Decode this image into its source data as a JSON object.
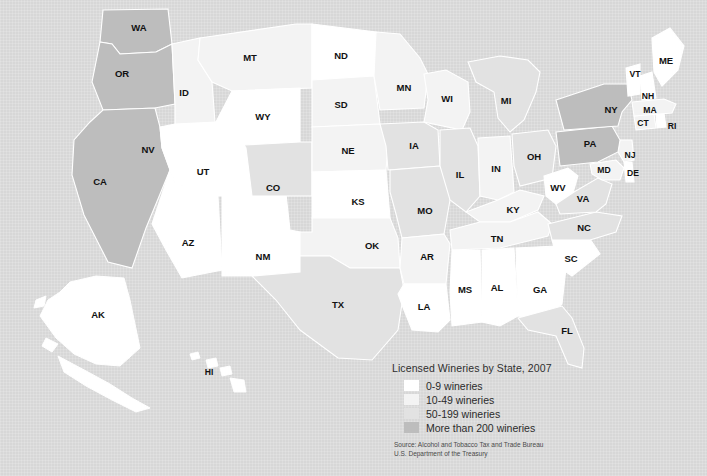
{
  "map": {
    "title": "Licensed Wineries by State, 2007",
    "background_color": "#d7d7d7",
    "border_color": "#ffffff",
    "label_color": "#111111"
  },
  "legend": {
    "title": "Licensed Wineries by State, 2007",
    "items": [
      {
        "label": "0-9 wineries",
        "color": "#ffffff"
      },
      {
        "label": "10-49 wineries",
        "color": "#f3f3f3"
      },
      {
        "label": "50-199 wineries",
        "color": "#e2e2e2"
      },
      {
        "label": "More than 200 wineries",
        "color": "#bdbdbd"
      }
    ],
    "source": "Source: Alcohol and Tobacco Tax and Trade Bureau\nU.S. Department of the Treasury"
  },
  "chart_data": {
    "type": "map",
    "title": "Licensed Wineries by State, 2007",
    "measure": "Number of licensed wineries",
    "year": 2007,
    "classes": [
      {
        "name": "0-9 wineries",
        "color": "#ffffff"
      },
      {
        "name": "10-49 wineries",
        "color": "#f3f3f3"
      },
      {
        "name": "50-199 wineries",
        "color": "#e2e2e2"
      },
      {
        "name": "More than 200 wineries",
        "color": "#bdbdbd"
      }
    ],
    "states": [
      {
        "code": "WA",
        "class": 3,
        "color": "#bdbdbd",
        "x": 139,
        "y": 28
      },
      {
        "code": "OR",
        "class": 3,
        "color": "#bdbdbd",
        "x": 122,
        "y": 74
      },
      {
        "code": "CA",
        "class": 3,
        "color": "#bdbdbd",
        "x": 100,
        "y": 182
      },
      {
        "code": "ID",
        "class": 1,
        "color": "#f3f3f3",
        "x": 184,
        "y": 93
      },
      {
        "code": "NV",
        "class": 0,
        "color": "#ffffff",
        "x": 148,
        "y": 150
      },
      {
        "code": "UT",
        "class": 0,
        "color": "#ffffff",
        "x": 203,
        "y": 172
      },
      {
        "code": "AZ",
        "class": 0,
        "color": "#ffffff",
        "x": 188,
        "y": 243
      },
      {
        "code": "NM",
        "class": 0,
        "color": "#ffffff",
        "x": 263,
        "y": 257
      },
      {
        "code": "MT",
        "class": 1,
        "color": "#f3f3f3",
        "x": 250,
        "y": 58
      },
      {
        "code": "WY",
        "class": 0,
        "color": "#ffffff",
        "x": 263,
        "y": 117
      },
      {
        "code": "CO",
        "class": 2,
        "color": "#e2e2e2",
        "x": 273,
        "y": 188
      },
      {
        "code": "ND",
        "class": 0,
        "color": "#ffffff",
        "x": 341,
        "y": 56
      },
      {
        "code": "SD",
        "class": 1,
        "color": "#f3f3f3",
        "x": 341,
        "y": 105
      },
      {
        "code": "NE",
        "class": 1,
        "color": "#f3f3f3",
        "x": 348,
        "y": 151
      },
      {
        "code": "KS",
        "class": 0,
        "color": "#ffffff",
        "x": 358,
        "y": 202
      },
      {
        "code": "OK",
        "class": 1,
        "color": "#f3f3f3",
        "x": 372,
        "y": 246
      },
      {
        "code": "TX",
        "class": 2,
        "color": "#e2e2e2",
        "x": 338,
        "y": 305
      },
      {
        "code": "MN",
        "class": 1,
        "color": "#f3f3f3",
        "x": 404,
        "y": 88
      },
      {
        "code": "IA",
        "class": 2,
        "color": "#e2e2e2",
        "x": 414,
        "y": 146
      },
      {
        "code": "MO",
        "class": 2,
        "color": "#e2e2e2",
        "x": 425,
        "y": 211
      },
      {
        "code": "AR",
        "class": 1,
        "color": "#f3f3f3",
        "x": 427,
        "y": 257
      },
      {
        "code": "LA",
        "class": 0,
        "color": "#ffffff",
        "x": 424,
        "y": 307
      },
      {
        "code": "WI",
        "class": 1,
        "color": "#f3f3f3",
        "x": 447,
        "y": 99
      },
      {
        "code": "IL",
        "class": 2,
        "color": "#e2e2e2",
        "x": 460,
        "y": 175
      },
      {
        "code": "MS",
        "class": 0,
        "color": "#ffffff",
        "x": 465,
        "y": 290
      },
      {
        "code": "AL",
        "class": 0,
        "color": "#ffffff",
        "x": 497,
        "y": 288
      },
      {
        "code": "MI",
        "class": 2,
        "color": "#e2e2e2",
        "x": 506,
        "y": 101
      },
      {
        "code": "IN",
        "class": 1,
        "color": "#f3f3f3",
        "x": 496,
        "y": 169
      },
      {
        "code": "OH",
        "class": 2,
        "color": "#e2e2e2",
        "x": 534,
        "y": 157
      },
      {
        "code": "KY",
        "class": 1,
        "color": "#f3f3f3",
        "x": 513,
        "y": 210
      },
      {
        "code": "TN",
        "class": 1,
        "color": "#f3f3f3",
        "x": 497,
        "y": 239
      },
      {
        "code": "GA",
        "class": 0,
        "color": "#ffffff",
        "x": 540,
        "y": 290
      },
      {
        "code": "FL",
        "class": 2,
        "color": "#e2e2e2",
        "x": 567,
        "y": 331
      },
      {
        "code": "SC",
        "class": 0,
        "color": "#ffffff",
        "x": 571,
        "y": 259
      },
      {
        "code": "NC",
        "class": 2,
        "color": "#e2e2e2",
        "x": 584,
        "y": 228
      },
      {
        "code": "WV",
        "class": 0,
        "color": "#ffffff",
        "x": 558,
        "y": 188
      },
      {
        "code": "VA",
        "class": 2,
        "color": "#e2e2e2",
        "x": 583,
        "y": 199
      },
      {
        "code": "MD",
        "class": 1,
        "color": "#f3f3f3",
        "x": 604,
        "y": 170
      },
      {
        "code": "DE",
        "class": 0,
        "color": "#ffffff",
        "x": 633,
        "y": 173
      },
      {
        "code": "NJ",
        "class": 1,
        "color": "#f3f3f3",
        "x": 630,
        "y": 155
      },
      {
        "code": "PA",
        "class": 3,
        "color": "#bdbdbd",
        "x": 590,
        "y": 144
      },
      {
        "code": "NY",
        "class": 3,
        "color": "#bdbdbd",
        "x": 611,
        "y": 110
      },
      {
        "code": "CT",
        "class": 1,
        "color": "#f3f3f3",
        "x": 643,
        "y": 123
      },
      {
        "code": "RI",
        "class": 0,
        "color": "#ffffff",
        "x": 672,
        "y": 126
      },
      {
        "code": "MA",
        "class": 1,
        "color": "#f3f3f3",
        "x": 650,
        "y": 110
      },
      {
        "code": "NH",
        "class": 0,
        "color": "#ffffff",
        "x": 648,
        "y": 96
      },
      {
        "code": "VT",
        "class": 0,
        "color": "#ffffff",
        "x": 635,
        "y": 74
      },
      {
        "code": "ME",
        "class": 0,
        "color": "#ffffff",
        "x": 666,
        "y": 61
      },
      {
        "code": "AK",
        "class": 0,
        "color": "#ffffff",
        "x": 98,
        "y": 315
      },
      {
        "code": "HI",
        "class": 0,
        "color": "#ffffff",
        "x": 209,
        "y": 372
      }
    ]
  }
}
